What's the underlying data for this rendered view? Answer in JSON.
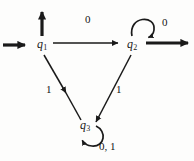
{
  "figure": {
    "background_color": "#fdfdfc",
    "ink_color": "#1a1a1a"
  },
  "states": [
    {
      "id": "q1",
      "name": "q",
      "subscript": "1",
      "x": 40,
      "y": 45,
      "role": "start-state"
    },
    {
      "id": "q2",
      "name": "q",
      "subscript": "2",
      "x": 130,
      "y": 45,
      "role": "accept-state"
    },
    {
      "id": "q3",
      "name": "q",
      "subscript": "3",
      "x": 83,
      "y": 126,
      "role": "trap-state"
    }
  ],
  "edge_labels": [
    {
      "id": "q1-q2-label",
      "text": "0",
      "x": 87,
      "y": 19
    },
    {
      "id": "q2-self-label",
      "text": "0",
      "x": 164,
      "y": 22
    },
    {
      "id": "q1-q3-label",
      "text": "1",
      "x": 48,
      "y": 89
    },
    {
      "id": "q2-q3-label",
      "text": "1",
      "x": 118,
      "y": 89
    },
    {
      "id": "q3-self-label",
      "text": "0, 1",
      "x": 102,
      "y": 146
    }
  ],
  "transitions": [
    {
      "from": "start",
      "to": "q1",
      "symbol": "",
      "kind": "start-arrow"
    },
    {
      "from": "q1",
      "to": "up",
      "symbol": "",
      "kind": "up-arrow"
    },
    {
      "from": "q1",
      "to": "q2",
      "symbol": "0",
      "kind": "straight"
    },
    {
      "from": "q2",
      "to": "q2",
      "symbol": "0",
      "kind": "self-loop"
    },
    {
      "from": "q2",
      "to": "right",
      "symbol": "",
      "kind": "accept-arrow"
    },
    {
      "from": "q1",
      "to": "q3",
      "symbol": "1",
      "kind": "diagonal"
    },
    {
      "from": "q2",
      "to": "q3",
      "symbol": "1",
      "kind": "diagonal"
    },
    {
      "from": "q3",
      "to": "q3",
      "symbol": "0, 1",
      "kind": "self-loop"
    }
  ]
}
